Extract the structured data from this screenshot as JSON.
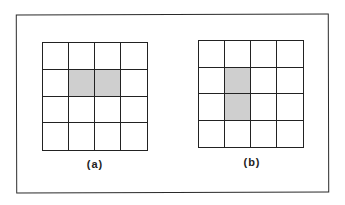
{
  "diagram": {
    "type": "grid-comparison",
    "colors": {
      "line": "#222222",
      "shaded": "#cfcfcf",
      "background": "#ffffff"
    },
    "panels": [
      {
        "id": "a",
        "label": "(a)",
        "rows": 4,
        "cols": 4,
        "shaded_cells": [
          [
            1,
            1
          ],
          [
            1,
            2
          ]
        ]
      },
      {
        "id": "b",
        "label": "(b)",
        "rows": 4,
        "cols": 4,
        "shaded_cells": [
          [
            1,
            1
          ],
          [
            2,
            1
          ]
        ]
      }
    ]
  }
}
